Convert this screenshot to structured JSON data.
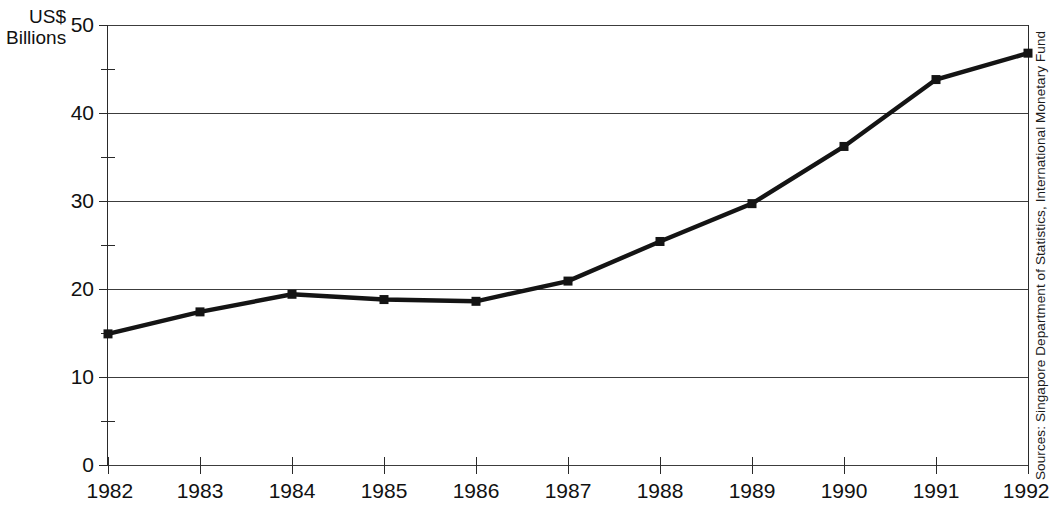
{
  "chart_data": {
    "type": "line",
    "title": "",
    "xlabel": "",
    "ylabel": "US$ Billions",
    "ylabel_lines": [
      "US$",
      "Billions"
    ],
    "categories": [
      "1982",
      "1983",
      "1984",
      "1985",
      "1986",
      "1987",
      "1988",
      "1989",
      "1990",
      "1991",
      "1992"
    ],
    "values": [
      14.9,
      17.4,
      19.4,
      18.8,
      18.6,
      20.9,
      25.4,
      29.7,
      36.2,
      43.8,
      46.8
    ],
    "series": [
      {
        "name": "US$ Billions",
        "values": [
          14.9,
          17.4,
          19.4,
          18.8,
          18.6,
          20.9,
          25.4,
          29.7,
          36.2,
          43.8,
          46.8
        ]
      }
    ],
    "ylim": [
      0,
      50
    ],
    "y_major_ticks": [
      0,
      10,
      20,
      30,
      40,
      50
    ],
    "y_minor_ticks": [
      5,
      15,
      25,
      35,
      45
    ],
    "y_tick_labels": [
      "0",
      "10",
      "20",
      "30",
      "40",
      "50"
    ],
    "grid": true,
    "grid_axis": "y",
    "legend": "none",
    "marker": "square",
    "line_color": "#141414",
    "marker_color": "#141414",
    "grid_color": "#3c3c3c",
    "axis_color": "#2a2a2a",
    "source_note": "Sources: Singapore Department of Statistics, International Monetary Fund",
    "annotations": []
  },
  "source": {
    "text": "Sources: Singapore Department of Statistics, International Monetary Fund"
  }
}
